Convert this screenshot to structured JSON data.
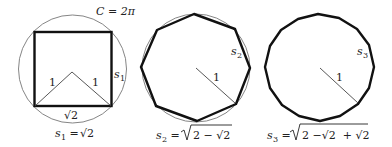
{
  "figure": {
    "circumference_label": "C = 2π",
    "colors": {
      "polygon": "#111111",
      "circle": "#777777",
      "radius": "#555555"
    }
  },
  "panels": [
    {
      "name": "square",
      "sides": 4,
      "side_label": "s",
      "side_label_sub": "1",
      "radius_label": "1",
      "base_label": "√2",
      "formula": {
        "lhs": "s",
        "lhs_sub": "1",
        "eq": " = ",
        "rhs": "√2"
      }
    },
    {
      "name": "octagon",
      "sides": 8,
      "side_label": "s",
      "side_label_sub": "2",
      "radius_label": "1",
      "formula": {
        "lhs": "s",
        "lhs_sub": "2",
        "eq": " = ",
        "rhs_radical": "2 − √2"
      }
    },
    {
      "name": "hexadecagon",
      "sides": 16,
      "side_label": "s",
      "side_label_sub": "3",
      "radius_label": "1",
      "formula": {
        "lhs": "s",
        "lhs_sub": "3",
        "eq": " = ",
        "rhs_radical": "2 −√2  + √2"
      }
    }
  ]
}
